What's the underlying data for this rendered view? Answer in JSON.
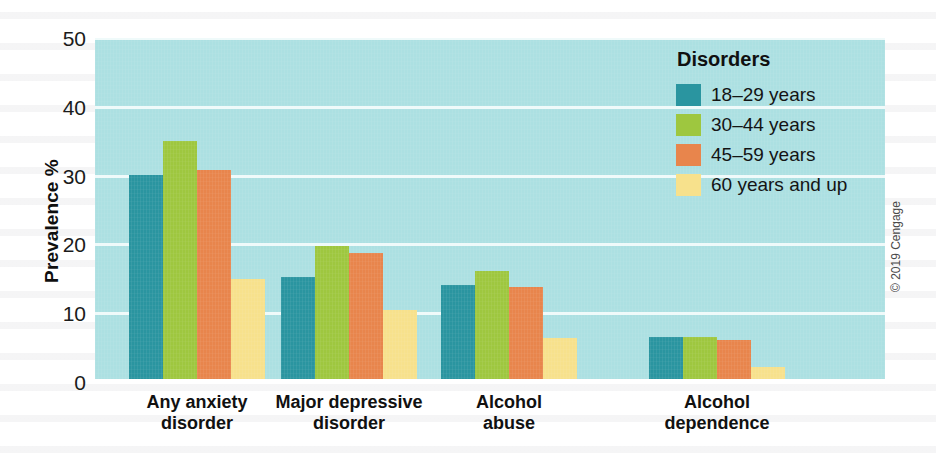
{
  "chart_data": {
    "type": "bar",
    "title": "",
    "xlabel": "",
    "ylabel": "Prevalence %",
    "ylim": [
      0,
      50
    ],
    "yticks": [
      0,
      10,
      20,
      30,
      40,
      50
    ],
    "grid": true,
    "legend_position": "top-right",
    "legend_title": "Disorders",
    "categories": [
      "Any anxiety disorder",
      "Major depressive disorder",
      "Alcohol abuse",
      "Alcohol dependence"
    ],
    "category_lines": [
      [
        "Any anxiety",
        "disorder"
      ],
      [
        "Major depressive",
        "disorder"
      ],
      [
        "Alcohol",
        "abuse"
      ],
      [
        "Alcohol",
        "dependence"
      ]
    ],
    "series": [
      {
        "name": "18–29 years",
        "color": "#2a95a0",
        "values": [
          30.1,
          15.3,
          14.1,
          6.5
        ]
      },
      {
        "name": "30–44 years",
        "color": "#9ec73f",
        "values": [
          35.1,
          19.8,
          16.1,
          6.5
        ]
      },
      {
        "name": "45–59 years",
        "color": "#e8854c",
        "values": [
          30.8,
          18.8,
          13.8,
          6.1
        ]
      },
      {
        "name": "60 years and up",
        "color": "#f7e18c",
        "values": [
          15.0,
          10.4,
          6.4,
          2.2
        ]
      }
    ]
  },
  "plot": {
    "background_color": "#ace0e2",
    "gridline_color": "#f2fbfb"
  },
  "credit": "© 2019 Cengage"
}
